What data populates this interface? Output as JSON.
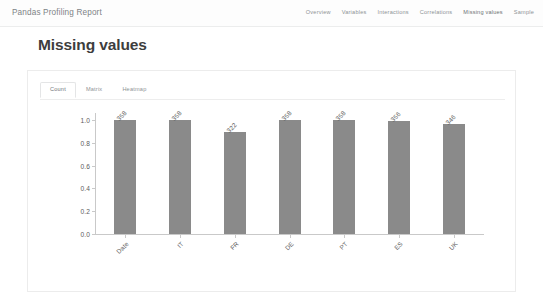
{
  "navbar": {
    "brand": "Pandas Profiling Report",
    "links": [
      {
        "label": "Overview",
        "active": false
      },
      {
        "label": "Variables",
        "active": false
      },
      {
        "label": "Interactions",
        "active": false
      },
      {
        "label": "Correlations",
        "active": false
      },
      {
        "label": "Missing values",
        "active": true
      },
      {
        "label": "Sample",
        "active": false
      }
    ]
  },
  "page": {
    "title": "Missing values"
  },
  "card": {
    "tabs": [
      {
        "label": "Count",
        "active": true
      },
      {
        "label": "Matrix",
        "active": false
      },
      {
        "label": "Heatmap",
        "active": false
      }
    ]
  },
  "colors": {
    "bar": "#8a8a8a",
    "axis": "#c9c9c9",
    "text": "#5c5c5c",
    "card_border": "#ececec",
    "nav_text": "#8d9295"
  },
  "chart_data": {
    "type": "bar",
    "title": "",
    "xlabel": "",
    "ylabel": "",
    "categories": [
      "Date",
      "IT",
      "FR",
      "DE",
      "PT",
      "ES",
      "UK"
    ],
    "values": [
      358,
      358,
      322,
      358,
      358,
      356,
      346
    ],
    "normalized": [
      1.0,
      1.0,
      0.899,
      1.0,
      1.0,
      0.994,
      0.966
    ],
    "ylim": [
      0.0,
      1.0
    ],
    "yticks": [
      "0.0",
      "0.2",
      "0.4",
      "0.6",
      "0.8",
      "1.0"
    ],
    "ytick_values": [
      0.0,
      0.2,
      0.4,
      0.6,
      0.8,
      1.0
    ],
    "grid": false,
    "legend": "none"
  }
}
